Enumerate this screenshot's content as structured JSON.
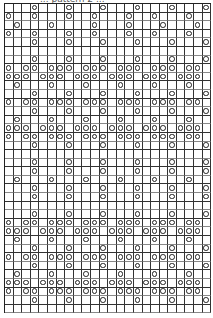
{
  "title": "... pattern 2 ...",
  "chart": {
    "type": "lace-knitting-chart",
    "columns": 24,
    "rows": 36,
    "symbol_legend": {
      "o": "yarn-over (circle)",
      ".": "empty / knit"
    },
    "colors": {
      "grid": "#333333",
      "symbol": "#222222",
      "background": "#ffffff"
    },
    "grid_rows": [
      "...o...o...o...o...o...o",
      "o..o...o..o...o..o...o..",
      ".o...o....o...o...o...o.",
      "o..o...o..o...o..o...o..",
      "...o...o...o...o...o...o",
      "........................",
      "...o...o...o...o...o...o",
      "o.oo.ooo.ooo.ooo.ooo.oo.",
      "ooo.ooo.ooo.ooo.ooo.ooo.",
      ".o...o...o...o...o...o..",
      "...o...o...o...o...o...o",
      "o.oo.ooo.ooo.ooo.ooo.oo.",
      "...o...o...o...o...o...o",
      ".o...o...o...o...o...o..",
      "ooo.ooo.ooo.ooo.ooo.ooo.",
      "o.oo.ooo.ooo.ooo.ooo.oo.",
      "...o...o...o...o...o...o",
      "........................",
      "...o...o...o...o...o...o",
      "...o...o...o...o...o...o",
      ".o...o...o...o...o...o..",
      "...o...o...o...o...o...o",
      "...o...o...o...o...o...o",
      "........................",
      "...o...o...o...o...o...o",
      "o.oo.ooo.ooo.ooo.ooo.oo.",
      "ooo.ooo.ooo.ooo.ooo.ooo.",
      ".o...o...o...o...o...o..",
      "...o...o...o...o...o...o",
      "o.oo.ooo.ooo.ooo.ooo.oo.",
      "...o...o...o...o...o...o",
      ".o...o...o...o...o...o..",
      "ooo.ooo.ooo.ooo.ooo.ooo.",
      "o.oo.ooo.ooo.ooo.ooo.oo.",
      "...o...o...o...o...o...o",
      "........................"
    ]
  }
}
